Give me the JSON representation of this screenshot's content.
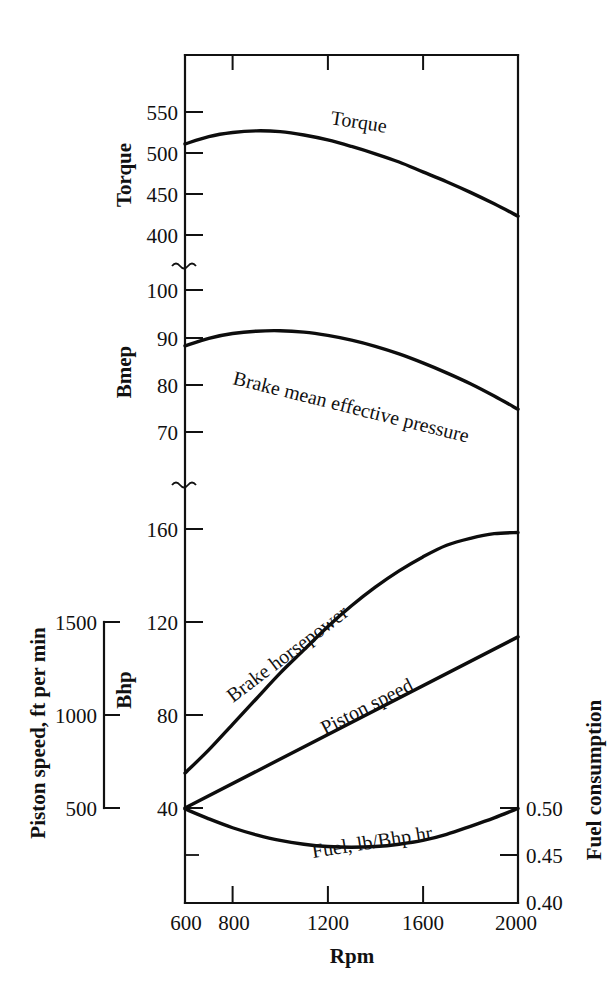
{
  "chart_data": {
    "type": "line",
    "title": "",
    "xlabel": "Rpm",
    "xlim": [
      600,
      2000
    ],
    "x_ticks": [
      600,
      800,
      1200,
      1600,
      2000
    ],
    "grid": false,
    "legend": "inline-curve-labels",
    "axes": [
      {
        "id": "torque",
        "label": "Torque",
        "side": "left",
        "ticks": [
          400,
          450,
          500,
          550
        ],
        "range": [
          400,
          560
        ],
        "broken": true
      },
      {
        "id": "bmep",
        "label": "Bmep",
        "side": "left",
        "ticks": [
          70,
          80,
          90,
          100
        ],
        "range": [
          66,
          104
        ],
        "broken": true
      },
      {
        "id": "bhp",
        "label": "Bhp",
        "side": "left",
        "ticks": [
          40,
          80,
          120,
          160
        ],
        "range": [
          28,
          172
        ]
      },
      {
        "id": "piston_speed",
        "label": "Piston speed, ft per min",
        "side": "far-left",
        "ticks": [
          500,
          1000,
          1500
        ],
        "range": [
          500,
          1500
        ]
      },
      {
        "id": "fuel",
        "label": "Fuel consumption",
        "side": "right",
        "ticks": [
          "0.40",
          "0.45",
          "0.50"
        ],
        "tick_values": [
          0.4,
          0.45,
          0.5
        ],
        "range": [
          0.395,
          0.515
        ]
      }
    ],
    "series": [
      {
        "name": "Torque",
        "axis": "torque",
        "label": "Torque",
        "x": [
          600,
          700,
          800,
          900,
          1000,
          1100,
          1200,
          1300,
          1400,
          1500,
          1600,
          1700,
          1800,
          1900,
          2000
        ],
        "values": [
          511,
          520,
          525,
          527,
          526,
          522,
          516,
          508,
          499,
          489,
          477,
          465,
          452,
          438,
          423
        ]
      },
      {
        "name": "Brake mean effective pressure",
        "axis": "bmep",
        "label": "Brake mean effective pressure",
        "x": [
          600,
          700,
          800,
          900,
          1000,
          1100,
          1200,
          1300,
          1400,
          1500,
          1600,
          1700,
          1800,
          1900,
          2000
        ],
        "values": [
          88.2,
          89.8,
          90.8,
          91.3,
          91.4,
          91.1,
          90.4,
          89.4,
          88.1,
          86.5,
          84.6,
          82.5,
          80.2,
          77.6,
          74.8
        ]
      },
      {
        "name": "Brake horsepower",
        "axis": "bhp",
        "label": "Brake horsepower",
        "x": [
          600,
          700,
          800,
          900,
          1000,
          1100,
          1200,
          1300,
          1400,
          1500,
          1600,
          1700,
          1800,
          1900,
          2000
        ],
        "values": [
          55,
          65,
          76,
          87,
          98,
          108,
          118,
          127,
          135,
          142,
          148,
          153,
          156,
          158,
          158.5
        ]
      },
      {
        "name": "Piston speed",
        "axis": "piston_speed",
        "label": "Piston speed",
        "x": [
          600,
          2000
        ],
        "values": [
          500,
          1420
        ]
      },
      {
        "name": "Fuel, lb/Bhp hr",
        "axis": "fuel",
        "label": "Fuel, lb/Bhp hr",
        "x": [
          600,
          700,
          800,
          900,
          1000,
          1100,
          1200,
          1300,
          1400,
          1500,
          1600,
          1700,
          1800,
          1900,
          2000
        ],
        "values": [
          0.499,
          0.4885,
          0.479,
          0.4715,
          0.4655,
          0.4615,
          0.459,
          0.4582,
          0.459,
          0.4615,
          0.4655,
          0.472,
          0.4805,
          0.4895,
          0.4995
        ]
      }
    ]
  }
}
